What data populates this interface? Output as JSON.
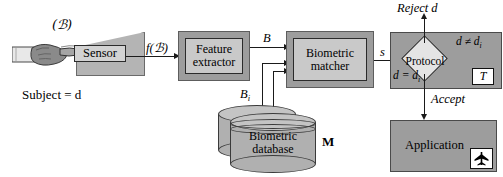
{
  "diagram": {
    "type": "block-flow-diagram",
    "colors": {
      "box_outer_frame": "#9d9d9d",
      "box_inner_panel": "#c9c9c9",
      "panel_fill": "#9d9d9d",
      "diamond_fill": "#e4e4e4",
      "line": "#1a1a1a",
      "background": "#ffffff",
      "cylinder_fill": "#b0b0b0",
      "white_box": "#ffffff"
    },
    "subject": {
      "biometric_symbol": "(ℬ)",
      "caption": "Subject = d",
      "icon": "hand-finger-icon"
    },
    "sensor": {
      "label": "Sensor",
      "device_icon": "scanner-wedge-icon"
    },
    "feature_extractor": {
      "line1": "Feature",
      "line2": "extractor"
    },
    "biometric_matcher": {
      "line1": "Biometric",
      "line2": "matcher"
    },
    "database": {
      "line1": "Biometric",
      "line2": "database",
      "set_label": "M",
      "icon": "database-cylinder-icon"
    },
    "protocol": {
      "label": "Protocol",
      "threshold_label": "T",
      "mismatch_condition": "d ≠ d",
      "mismatch_subscript": "i",
      "match_condition": "d = d",
      "match_subscript": "i"
    },
    "application": {
      "label": "Application",
      "icon": "airplane-icon"
    },
    "edges": [
      {
        "name": "sensor-output",
        "label": "f(ℬ)"
      },
      {
        "name": "extractor-output",
        "label": "B"
      },
      {
        "name": "database-output",
        "label": "B",
        "subscript": "i"
      },
      {
        "name": "matcher-output",
        "label": "s"
      },
      {
        "name": "protocol-reject",
        "label": "Reject d"
      },
      {
        "name": "protocol-accept",
        "label": "Accept"
      }
    ]
  }
}
